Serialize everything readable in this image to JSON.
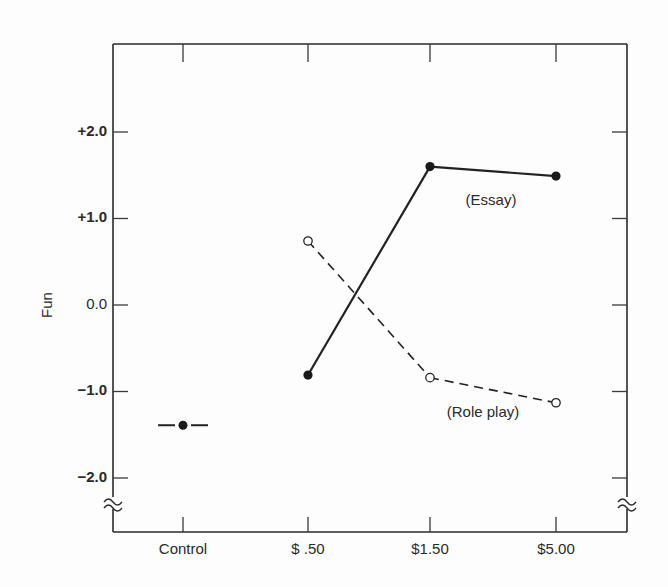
{
  "chart_data": {
    "type": "line",
    "title": "",
    "xlabel": "",
    "ylabel": "Fun",
    "ylim": [
      -2.5,
      2.5
    ],
    "categories": [
      "Control",
      "$ .50",
      "$1.50",
      "$5.00"
    ],
    "yticks": [
      {
        "value": 2.0,
        "label": "+2.0"
      },
      {
        "value": 1.0,
        "label": "+1.0"
      },
      {
        "value": 0.0,
        "label": "0.0"
      },
      {
        "value": -1.0,
        "label": "−1.0"
      },
      {
        "value": -2.0,
        "label": "−2.0"
      }
    ],
    "axis_break": "below -2.0 on both vertical axes",
    "grid": false,
    "series": [
      {
        "name": "Essay",
        "label": "(Essay)",
        "style": "solid",
        "marker": "filled-circle",
        "x": [
          "$ .50",
          "$1.50",
          "$5.00"
        ],
        "values": [
          -0.81,
          1.6,
          1.49
        ]
      },
      {
        "name": "Role play",
        "label": "(Role play)",
        "style": "dashed",
        "marker": "open-circle",
        "x": [
          "$ .50",
          "$1.50",
          "$5.00"
        ],
        "values": [
          0.74,
          -0.84,
          -1.13
        ]
      },
      {
        "name": "Control",
        "label": "",
        "style": "point-with-bar",
        "marker": "filled-circle",
        "x": [
          "Control"
        ],
        "values": [
          -1.39
        ]
      }
    ]
  }
}
